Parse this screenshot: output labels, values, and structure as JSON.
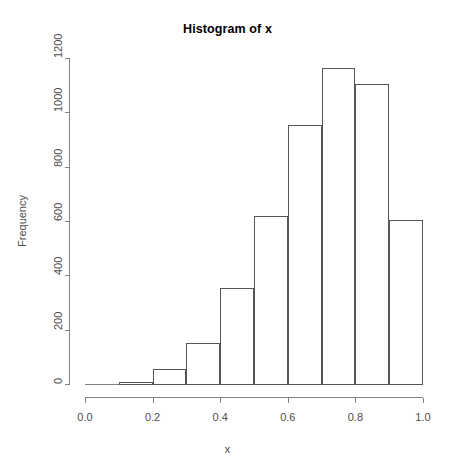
{
  "chart_data": {
    "type": "bar",
    "title": "Histogram of x",
    "xlabel": "x",
    "ylabel": "Frequency",
    "categories": [
      "0.0-0.1",
      "0.1-0.2",
      "0.2-0.3",
      "0.3-0.4",
      "0.4-0.5",
      "0.5-0.6",
      "0.6-0.7",
      "0.7-0.8",
      "0.8-0.9",
      "0.9-1.0"
    ],
    "bin_edges": [
      0.0,
      0.1,
      0.2,
      0.3,
      0.4,
      0.5,
      0.6,
      0.7,
      0.8,
      0.9,
      1.0
    ],
    "values": [
      0,
      8,
      55,
      150,
      355,
      618,
      955,
      1165,
      1105,
      605
    ],
    "xlim": [
      0.0,
      1.0
    ],
    "ylim": [
      0,
      1200
    ],
    "xticks": [
      0.0,
      0.2,
      0.4,
      0.6,
      0.8,
      1.0
    ],
    "xtick_labels": [
      "0.0",
      "0.2",
      "0.4",
      "0.6",
      "0.8",
      "1.0"
    ],
    "yticks": [
      0,
      200,
      400,
      600,
      800,
      1000,
      1200
    ],
    "ytick_labels": [
      "0",
      "200",
      "400",
      "600",
      "800",
      "1000",
      "1200"
    ],
    "grid": false,
    "legend": null,
    "bar_fill": "#ffffff",
    "bar_stroke": "#000000",
    "axis_color": "#808080",
    "text_color": "#4d4d4d"
  }
}
